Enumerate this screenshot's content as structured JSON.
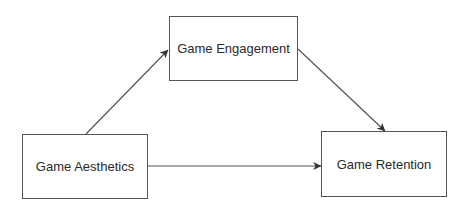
{
  "diagram": {
    "type": "path-model",
    "colors": {
      "stroke": "#555555",
      "text": "#2a2a2a",
      "background": "#ffffff"
    },
    "nodes": [
      {
        "id": "aesthetics",
        "label": "Game Aesthetics",
        "x": 22,
        "y": 134,
        "w": 126,
        "h": 65
      },
      {
        "id": "engagement",
        "label": "Game Engagement",
        "x": 169,
        "y": 16,
        "w": 129,
        "h": 65
      },
      {
        "id": "retention",
        "label": "Game Retention",
        "x": 321,
        "y": 131,
        "w": 126,
        "h": 66
      }
    ],
    "edges": [
      {
        "from": "aesthetics",
        "to": "engagement",
        "x1": 86,
        "y1": 134,
        "x2": 168,
        "y2": 50
      },
      {
        "from": "engagement",
        "to": "retention",
        "x1": 298,
        "y1": 49,
        "x2": 385,
        "y2": 131
      },
      {
        "from": "aesthetics",
        "to": "retention",
        "x1": 148,
        "y1": 166,
        "x2": 321,
        "y2": 166
      }
    ]
  }
}
